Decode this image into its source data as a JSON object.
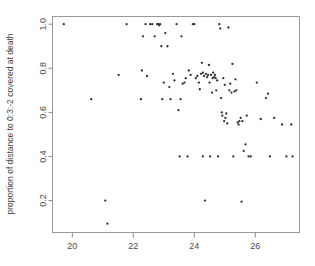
{
  "chart_data": {
    "type": "scatter",
    "title": "",
    "xlabel": "",
    "ylabel": "proportion of distance to 0:3:-2 covered at death",
    "xlim": [
      19.35,
      27.45
    ],
    "ylim": [
      0.055,
      1.035
    ],
    "grid": false,
    "legend": null,
    "xticks": [
      20,
      22,
      24,
      26
    ],
    "xtick_labels": [
      "20",
      "22",
      "24",
      "26"
    ],
    "yticks": [
      0.2,
      0.4,
      0.6,
      0.8,
      1.0
    ],
    "ytick_labels": [
      "0.2",
      "0.4",
      "0.6",
      "0.8",
      "1.0"
    ],
    "marker": "point",
    "marker_color": "#2e2e2e",
    "n_points": 107,
    "x": [
      19.72,
      20.62,
      21.08,
      21.15,
      21.52,
      21.78,
      22.25,
      22.28,
      22.32,
      22.4,
      22.45,
      22.55,
      22.62,
      22.7,
      22.78,
      22.82,
      22.85,
      22.88,
      22.92,
      22.95,
      23.0,
      23.05,
      23.12,
      23.18,
      23.22,
      23.3,
      23.35,
      23.42,
      23.48,
      23.52,
      23.55,
      23.58,
      23.62,
      23.68,
      23.72,
      23.78,
      23.82,
      23.88,
      23.95,
      24.0,
      24.05,
      24.1,
      24.15,
      24.18,
      24.22,
      24.25,
      24.28,
      24.32,
      24.35,
      24.38,
      24.42,
      24.45,
      24.48,
      24.5,
      24.52,
      24.55,
      24.58,
      24.6,
      24.62,
      24.65,
      24.68,
      24.7,
      24.72,
      24.75,
      24.78,
      24.82,
      24.85,
      24.88,
      24.9,
      24.92,
      24.95,
      24.98,
      25.0,
      25.02,
      25.05,
      25.08,
      25.12,
      25.15,
      25.18,
      25.22,
      25.25,
      25.28,
      25.32,
      25.35,
      25.38,
      25.42,
      25.45,
      25.48,
      25.52,
      25.55,
      25.58,
      25.62,
      25.68,
      25.72,
      25.78,
      25.85,
      26.05,
      26.18,
      26.35,
      26.42,
      26.48,
      26.62,
      26.88,
      27.02,
      27.18,
      27.22,
      24.28
    ],
    "y": [
      1.0,
      0.66,
      0.2,
      0.095,
      0.77,
      1.0,
      0.66,
      0.79,
      0.945,
      1.0,
      0.765,
      1.0,
      1.0,
      0.945,
      1.0,
      1.0,
      0.995,
      1.0,
      0.9,
      0.66,
      0.735,
      0.96,
      0.9,
      0.715,
      0.66,
      0.775,
      0.745,
      1.0,
      0.61,
      0.4,
      0.66,
      0.945,
      0.73,
      0.735,
      0.755,
      0.4,
      0.79,
      0.77,
      1.0,
      1.0,
      0.755,
      0.765,
      0.735,
      0.705,
      0.775,
      0.825,
      0.78,
      0.765,
      0.2,
      0.775,
      0.76,
      0.77,
      0.815,
      0.735,
      0.4,
      0.77,
      0.69,
      0.755,
      0.78,
      0.76,
      0.77,
      0.755,
      0.7,
      0.745,
      0.4,
      1.0,
      0.98,
      0.665,
      0.6,
      0.585,
      0.755,
      0.56,
      0.725,
      0.575,
      0.595,
      0.55,
      0.985,
      0.7,
      0.73,
      0.69,
      0.82,
      0.4,
      0.695,
      0.75,
      0.7,
      0.555,
      0.545,
      0.56,
      0.575,
      0.195,
      0.56,
      0.425,
      0.455,
      0.585,
      0.4,
      0.4,
      0.735,
      0.57,
      0.665,
      0.685,
      0.4,
      0.575,
      0.545,
      0.4,
      0.545,
      0.4,
      0.4
    ]
  },
  "figure": {
    "background_color": "#ffffff",
    "axis_color": "#8a8a8a",
    "point_color": "#2e2e2e"
  }
}
